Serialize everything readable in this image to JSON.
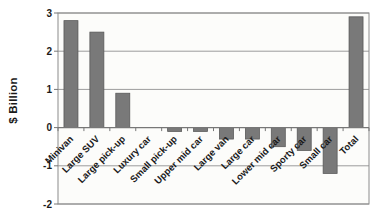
{
  "chart_data": {
    "type": "bar",
    "title": "",
    "xlabel": "",
    "ylabel": "$ Billion",
    "categories": [
      "Minivan",
      "Large SUV",
      "Large pick-up",
      "Luxury car",
      "Small pick-up",
      "Upper mid car",
      "Large van",
      "Large car",
      "Lower mid car",
      "Sporty car",
      "Small car",
      "Total"
    ],
    "values": [
      2.8,
      2.5,
      0.9,
      0,
      -0.1,
      -0.1,
      -0.3,
      -0.3,
      -0.5,
      -0.6,
      -1.2,
      2.9
    ],
    "ylim": [
      -2,
      3
    ],
    "yticks": [
      3,
      2,
      1,
      0,
      -1,
      -2
    ],
    "grid": true,
    "legend": false,
    "bar_color": "#797979",
    "bar_border_color": "#565656",
    "grid_color": "#9c9c9c",
    "axis_color": "#777777",
    "plot_border_color": "#8c8c8c",
    "plot_bg": "#fcfcfa",
    "text_color": "#1a1a1a"
  }
}
